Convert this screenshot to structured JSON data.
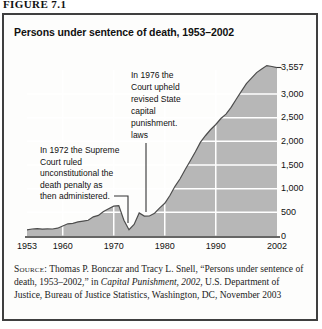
{
  "figure_label": "FIGURE 7.1",
  "chart_title": "Persons under sentence of death, 1953–2002",
  "annotations": {
    "ruling_1972": "In 1972 the Supreme\nCourt ruled\nunconstitutional the\ndeath penalty as\nthen administered.",
    "ruling_1976": "In 1976 the\nCourt upheld\nrevised State\ncapital\npunishment.\nlaws"
  },
  "source": {
    "label": "Source:",
    "text_before_italic": " Thomas P. Bonczar and Tracy L. Snell, “Persons under sentence of death, 1953–2002,” in ",
    "italic": "Capital Punishment, 2002",
    "text_after_italic": ", U.S. Department of Justice, Bureau of Justice Statistics, Washington, DC, November 2003"
  },
  "colors": {
    "area_fill": "#b7b7b7",
    "area_outline": "#4d4d4d",
    "gridline": "#ffffff",
    "axis_line": "#333333",
    "box_border": "#3f3f3f",
    "text": "#1a1a1a",
    "background": "#ffffff"
  },
  "chart_data": {
    "type": "area",
    "title": "Persons under sentence of death, 1953–2002",
    "xlabel": "",
    "ylabel": "",
    "grid": true,
    "legend": false,
    "ylim": [
      0,
      3650
    ],
    "xlim": [
      1953,
      2002
    ],
    "peak_label": "3,557",
    "x": [
      1953,
      1954,
      1955,
      1956,
      1957,
      1958,
      1959,
      1960,
      1961,
      1962,
      1963,
      1964,
      1965,
      1966,
      1967,
      1968,
      1969,
      1970,
      1971,
      1972,
      1973,
      1974,
      1975,
      1976,
      1977,
      1978,
      1979,
      1980,
      1981,
      1982,
      1983,
      1984,
      1985,
      1986,
      1987,
      1988,
      1989,
      1990,
      1991,
      1992,
      1993,
      1994,
      1995,
      1996,
      1997,
      1998,
      1999,
      2000,
      2001,
      2002
    ],
    "series": [
      {
        "name": "Persons under sentence of death",
        "values": [
          131,
          147,
          157,
          146,
          151,
          147,
          164,
          212,
          257,
          267,
          297,
          315,
          331,
          406,
          435,
          517,
          575,
          631,
          642,
          334,
          134,
          244,
          488,
          420,
          423,
          482,
          593,
          691,
          856,
          1050,
          1209,
          1405,
          1591,
          1781,
          1984,
          2124,
          2250,
          2356,
          2482,
          2575,
          2716,
          2890,
          3054,
          3219,
          3335,
          3452,
          3527,
          3601,
          3581,
          3557
        ]
      }
    ],
    "xticks": [
      {
        "year": 1953,
        "label": "1953",
        "gridline": false
      },
      {
        "year": 1960,
        "label": "1960",
        "gridline": true
      },
      {
        "year": 1970,
        "label": "1970",
        "gridline": true
      },
      {
        "year": 1980,
        "label": "1980",
        "gridline": true
      },
      {
        "year": 1990,
        "label": "1990",
        "gridline": true
      },
      {
        "year": 2002,
        "label": "2002",
        "gridline": false
      }
    ],
    "yticks": [
      {
        "value": 3557,
        "label": "3,557",
        "gridline": false
      },
      {
        "value": 3000,
        "label": "3,000",
        "gridline": true
      },
      {
        "value": 2500,
        "label": "2,500",
        "gridline": true
      },
      {
        "value": 2000,
        "label": "2,000",
        "gridline": true
      },
      {
        "value": 1500,
        "label": "1,500",
        "gridline": true
      },
      {
        "value": 1000,
        "label": "1,000",
        "gridline": true
      },
      {
        "value": 500,
        "label": "500",
        "gridline": true
      },
      {
        "value": 0,
        "label": "0",
        "gridline": false
      }
    ]
  }
}
